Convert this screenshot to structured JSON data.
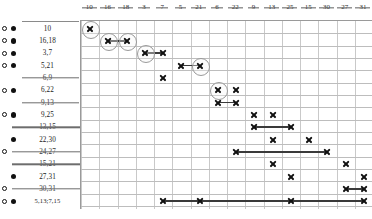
{
  "chart_data": {
    "type": "bar",
    "title": "",
    "xlabel": "",
    "ylabel": "",
    "grid": true,
    "legend": null,
    "x_axis_position": "top",
    "x_tick_labels": [
      "10",
      "16",
      "18",
      "3",
      "7",
      "5",
      "21",
      "6",
      "22",
      "9",
      "13",
      "25",
      "15",
      "30",
      "27",
      "31"
    ],
    "x_tick_obscured": true,
    "row_labels": [
      "10",
      "16,18",
      "3,7",
      "5,21",
      "6,9",
      "6,22",
      "9,13",
      "9,25",
      "13,15",
      "22,30",
      "24,27",
      "15,21",
      "27,31",
      "30,31",
      "5,13;7,15"
    ],
    "row_label_obscured": [
      false,
      false,
      false,
      false,
      true,
      false,
      true,
      false,
      true,
      false,
      true,
      true,
      false,
      true,
      false
    ],
    "row_markers": [
      {
        "open": true,
        "filled": true
      },
      {
        "open": true,
        "filled": true
      },
      {
        "open": true,
        "filled": true
      },
      {
        "open": true,
        "filled": true
      },
      {
        "open": false,
        "filled": false
      },
      {
        "open": true,
        "filled": true
      },
      {
        "open": false,
        "filled": false
      },
      {
        "open": true,
        "filled": true
      },
      {
        "open": false,
        "filled": false
      },
      {
        "open": false,
        "filled": true
      },
      {
        "open": true,
        "filled": false
      },
      {
        "open": false,
        "filled": false
      },
      {
        "open": false,
        "filled": true
      },
      {
        "open": true,
        "filled": false
      },
      {
        "open": true,
        "filled": true
      }
    ],
    "series": [
      {
        "name": "10",
        "row": 0,
        "points": [
          0
        ],
        "interval": null,
        "highlighted": [
          0
        ]
      },
      {
        "name": "16,18",
        "row": 1,
        "points": [
          1,
          2
        ],
        "interval": [
          1,
          2
        ],
        "highlighted": [
          1,
          2
        ]
      },
      {
        "name": "3,7",
        "row": 2,
        "points": [
          3,
          4
        ],
        "interval": [
          3,
          4
        ],
        "highlighted": [
          3
        ]
      },
      {
        "name": "5,21",
        "row": 3,
        "points": [
          5,
          6
        ],
        "interval": [
          5,
          6
        ],
        "highlighted": [
          6
        ]
      },
      {
        "name": "6,9",
        "row": 4,
        "points": [
          4
        ],
        "interval": null,
        "highlighted": []
      },
      {
        "name": "6,22",
        "row": 5,
        "points": [
          7,
          8
        ],
        "interval": null,
        "highlighted": [
          7
        ]
      },
      {
        "name": "9,13",
        "row": 6,
        "points": [
          7,
          8
        ],
        "interval": [
          7,
          8
        ],
        "highlighted": []
      },
      {
        "name": "9,25",
        "row": 7,
        "points": [
          9,
          10
        ],
        "interval": null,
        "highlighted": []
      },
      {
        "name": "13,15",
        "row": 8,
        "points": [
          9,
          11
        ],
        "interval": [
          9,
          11
        ],
        "highlighted": []
      },
      {
        "name": "22,30",
        "row": 9,
        "points": [
          10,
          12
        ],
        "interval": null,
        "highlighted": []
      },
      {
        "name": "24,27",
        "row": 10,
        "points": [
          8,
          13
        ],
        "interval": [
          8,
          13
        ],
        "highlighted": []
      },
      {
        "name": "15,21",
        "row": 11,
        "points": [
          10,
          14
        ],
        "interval": null,
        "highlighted": []
      },
      {
        "name": "27,31",
        "row": 12,
        "points": [
          11,
          15
        ],
        "interval": null,
        "highlighted": []
      },
      {
        "name": "30,31",
        "row": 13,
        "points": [
          14,
          15
        ],
        "interval": [
          14,
          15
        ],
        "highlighted": []
      },
      {
        "name": "5,13;7,15",
        "row": 14,
        "points": [
          4,
          6,
          11,
          15
        ],
        "interval": [
          4,
          15
        ],
        "highlighted": []
      }
    ]
  }
}
